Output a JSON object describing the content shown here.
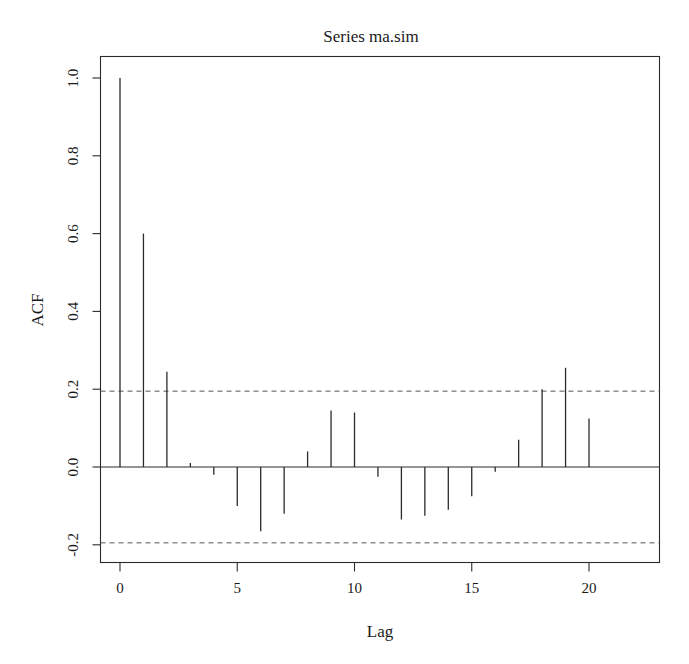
{
  "chart_data": {
    "type": "bar",
    "title": "Series  ma.sim",
    "xlabel": "Lag",
    "ylabel": "ACF",
    "grid": false,
    "legend": false,
    "xlim": [
      -0.5,
      20.5
    ],
    "ylim": [
      -0.28,
      1.06
    ],
    "xticks": [
      0,
      5,
      10,
      15,
      20
    ],
    "xticklabels": [
      "0",
      "5",
      "10",
      "15",
      "20"
    ],
    "yticks": [
      -0.2,
      0.0,
      0.2,
      0.4,
      0.6,
      0.8,
      1.0
    ],
    "yticklabels": [
      "-0.2",
      "0.0",
      "0.2",
      "0.4",
      "0.6",
      "0.8",
      "1.0"
    ],
    "categories": [
      0,
      1,
      2,
      3,
      4,
      5,
      6,
      7,
      8,
      9,
      10,
      11,
      12,
      13,
      14,
      15,
      16,
      17,
      18,
      19,
      20
    ],
    "values": [
      1.0,
      0.6,
      0.245,
      0.01,
      -0.02,
      -0.1,
      -0.165,
      -0.12,
      0.04,
      0.145,
      0.14,
      -0.025,
      -0.135,
      -0.125,
      -0.11,
      -0.075,
      -0.012,
      0.07,
      0.2,
      0.255,
      0.125
    ],
    "confidence_bands": [
      0.195,
      -0.195
    ],
    "confidence_band_style": "dashed",
    "zero_reference": 0.0,
    "series": [
      {
        "name": "ACF",
        "values": [
          1.0,
          0.6,
          0.245,
          0.01,
          -0.02,
          -0.1,
          -0.165,
          -0.12,
          0.04,
          0.145,
          0.14,
          -0.025,
          -0.135,
          -0.125,
          -0.11,
          -0.075,
          -0.012,
          0.07,
          0.2,
          0.255,
          0.125
        ]
      }
    ]
  },
  "figure": {
    "background_color": "#ffffff",
    "line_color": "#2b2b2b",
    "confidence_color": "#555555"
  }
}
